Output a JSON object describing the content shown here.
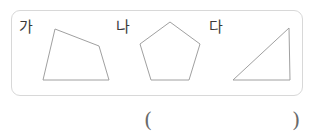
{
  "page": {
    "background_color": "#ffffff",
    "figure_box": {
      "border_color": "#d8d8d8",
      "corner_radius": "9px"
    }
  },
  "figures": {
    "stroke_color": "#a0a0a0",
    "fill_color": "#ffffff",
    "items": [
      {
        "label": "가",
        "shape": "quadrilateral",
        "points": "55,29 99,46 109,80 43,80"
      },
      {
        "label": "나",
        "shape": "pentagon",
        "points": "170,22 200,44 189,80 151,80 140,44"
      },
      {
        "label": "다",
        "shape": "right-triangle",
        "points": "289,28 290,80 233,80"
      }
    ]
  },
  "answer": {
    "open_paren": "(",
    "close_paren": ")",
    "blank_value": ""
  }
}
